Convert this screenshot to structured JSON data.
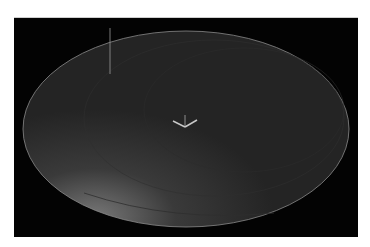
{
  "viewport": {
    "name": "3d-viewport",
    "background": "#030303"
  },
  "scene": {
    "disc": {
      "cx": 172,
      "cy": 111,
      "rx": 163,
      "ry": 98,
      "fill": "#262626",
      "edge": "#8a8a8a",
      "glow": "#6a6a6a"
    },
    "marker_line": {
      "x": 96,
      "y1": 10,
      "y2": 56,
      "color": "#9a9a9a"
    },
    "gizmo": {
      "cx": 171,
      "cy": 107,
      "color": "#c8c8c8"
    }
  }
}
